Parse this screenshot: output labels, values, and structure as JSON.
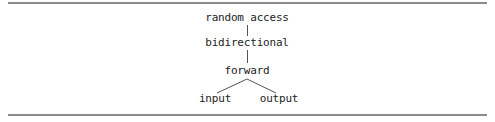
{
  "diagram": {
    "type": "hierarchy",
    "nodes": [
      {
        "id": "random_access",
        "label": "random access",
        "x": 247,
        "y": 12
      },
      {
        "id": "bidirectional",
        "label": "bidirectional",
        "x": 247,
        "y": 37
      },
      {
        "id": "forward",
        "label": "forward",
        "x": 247,
        "y": 65
      },
      {
        "id": "input",
        "label": "input",
        "x": 215,
        "y": 93
      },
      {
        "id": "output",
        "label": "output",
        "x": 279,
        "y": 93
      }
    ],
    "edges": [
      {
        "from": "random_access",
        "to": "bidirectional"
      },
      {
        "from": "bidirectional",
        "to": "forward"
      },
      {
        "from": "forward",
        "to": "input"
      },
      {
        "from": "forward",
        "to": "output"
      }
    ],
    "colors": {
      "rule": "#8c8c8c",
      "text": "#222222",
      "edge": "#555555",
      "background": "#ffffff"
    }
  }
}
